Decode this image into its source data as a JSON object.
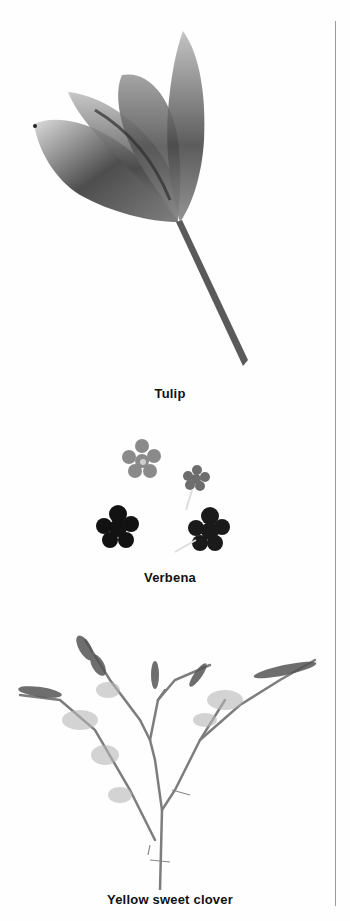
{
  "plate": {
    "colors": {
      "background": "#fefefe",
      "rule": "#9a9a9a",
      "caption": "#111111"
    },
    "specimens": [
      {
        "name": "Tulip",
        "caption": "Tulip",
        "icon": "tulip-illustration"
      },
      {
        "name": "Verbena",
        "caption": "Verbena",
        "icon": "verbena-illustration"
      },
      {
        "name": "Yellow sweet clover",
        "caption": "Yellow sweet clover",
        "icon": "sweet-clover-illustration"
      }
    ]
  }
}
